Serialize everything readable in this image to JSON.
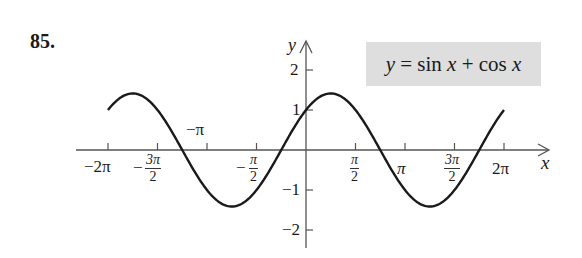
{
  "problem": {
    "number": "85."
  },
  "legend": {
    "y": "y",
    "eq": "=",
    "sin": "sin",
    "x1": "x",
    "plus": "+",
    "cos": "cos",
    "x2": "x"
  },
  "axes": {
    "x_label": "x",
    "y_label": "y",
    "x_ticks": [
      {
        "label": "−2π"
      },
      {
        "sign": "−",
        "num": "3π",
        "den": "2"
      },
      {
        "label": "−π"
      },
      {
        "sign": "−",
        "num": "π",
        "den": "2"
      },
      {
        "num": "π",
        "den": "2"
      },
      {
        "label": "π"
      },
      {
        "num": "3π",
        "den": "2"
      },
      {
        "label": "2π"
      }
    ],
    "y_ticks": [
      "2",
      "1",
      "−1",
      "−2"
    ]
  },
  "colors": {
    "curve": "#1a1a1a",
    "axis": "#555555",
    "legend_bg": "#dedede"
  },
  "chart_data": {
    "type": "line",
    "xlabel": "x",
    "ylabel": "y",
    "xlim": [
      -6.2832,
      6.2832
    ],
    "ylim": [
      -2.5,
      2.5
    ],
    "grid": false,
    "x_tick_values": [
      -6.2832,
      -4.7124,
      -3.1416,
      -1.5708,
      1.5708,
      3.1416,
      4.7124,
      6.2832
    ],
    "x_tick_labels": [
      "−2π",
      "−3π/2",
      "−π",
      "−π/2",
      "π/2",
      "π",
      "3π/2",
      "2π"
    ],
    "y_tick_values": [
      -2,
      -1,
      1,
      2
    ],
    "series": [
      {
        "name": "y = sin x + cos x",
        "x": [
          -6.2832,
          -5.4978,
          -4.7124,
          -3.927,
          -3.1416,
          -2.3562,
          -1.5708,
          -0.7854,
          0,
          0.7854,
          1.5708,
          2.3562,
          3.1416,
          3.927,
          4.7124,
          5.4978,
          6.2832
        ],
        "values": [
          1,
          1.414,
          1,
          0,
          -1,
          -1.414,
          -1,
          0,
          1,
          1.414,
          1,
          0,
          -1,
          -1.414,
          -1,
          0,
          1
        ]
      }
    ],
    "annotations": [
      {
        "text": "y = sin x + cos x",
        "position": "top-right",
        "boxed": true
      }
    ]
  }
}
